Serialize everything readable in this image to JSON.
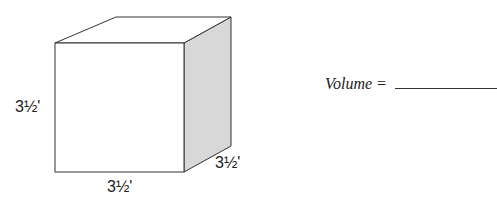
{
  "figure": {
    "shape": "cube",
    "colors": {
      "stroke": "#333333",
      "front_face": "#ffffff",
      "top_face": "#ffffff",
      "side_face": "#d8d8d8"
    },
    "labels": {
      "height": "3½'",
      "width": "3½'",
      "depth": "3½'"
    }
  },
  "question": {
    "label": "Volume =",
    "answer": ""
  }
}
